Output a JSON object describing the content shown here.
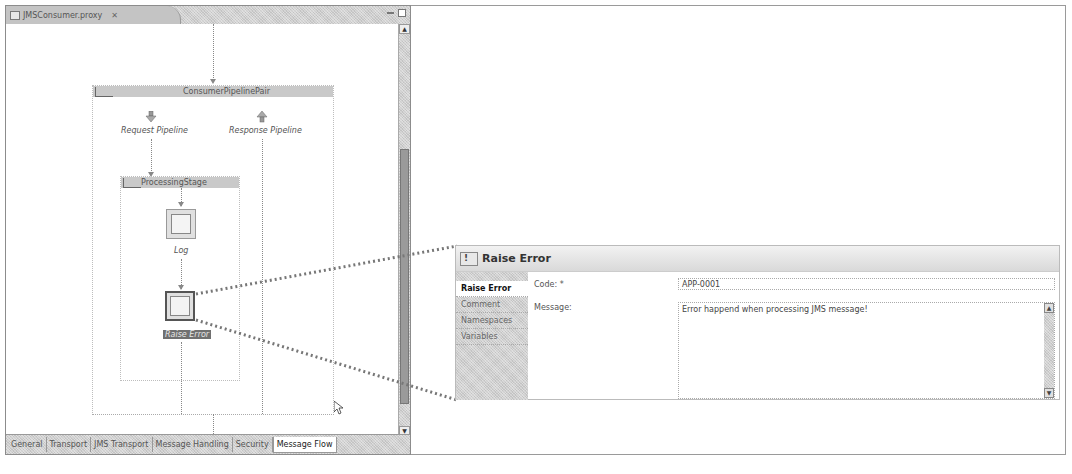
{
  "editor": {
    "tab_title": "JMSConsumer.proxy",
    "tab_close": "✕",
    "scroll_up": "▲",
    "scroll_down": "▼",
    "bottom_tabs": [
      {
        "label": "General"
      },
      {
        "label": "Transport"
      },
      {
        "label": "JMS Transport"
      },
      {
        "label": "Message Handling"
      },
      {
        "label": "Security"
      },
      {
        "label": "Message Flow",
        "active": true
      }
    ]
  },
  "diagram": {
    "pipeline_pair": {
      "title": "ConsumerPipelinePair"
    },
    "request_pipeline": {
      "label": "Request Pipeline"
    },
    "response_pipeline": {
      "label": "Response Pipeline"
    },
    "stage": {
      "title": "ProcessingStage"
    },
    "nodes": [
      {
        "label": "Log",
        "icon": "log-icon",
        "selected": false
      },
      {
        "label": "Raise Error",
        "icon": "raise-error-icon",
        "selected": true
      }
    ]
  },
  "properties": {
    "title": "Raise Error",
    "tabs": [
      {
        "label": "Raise Error",
        "active": true
      },
      {
        "label": "Comment"
      },
      {
        "label": "Namespaces"
      },
      {
        "label": "Variables"
      }
    ],
    "fields": {
      "code_label": "Code: *",
      "code_value": "APP-0001",
      "message_label": "Message:",
      "message_value": "Error happend when processing JMS message!"
    },
    "scroll_up": "▲",
    "scroll_down": "▼"
  }
}
